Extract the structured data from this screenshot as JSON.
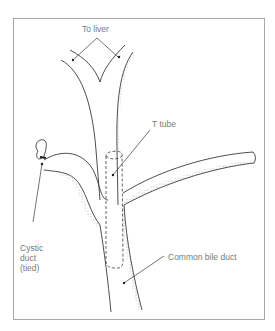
{
  "figure": {
    "labels": {
      "to_liver": "To liver",
      "t_tube": "T tube",
      "cystic_duct": [
        "Cystic",
        "duct",
        "(tied)"
      ],
      "common_bile_duct": "Common bile duct"
    },
    "colors": {
      "line": "#3a3a3a",
      "label_text": "#7a7a7a",
      "frame": "#a8a8a8",
      "background": "#ffffff"
    }
  }
}
